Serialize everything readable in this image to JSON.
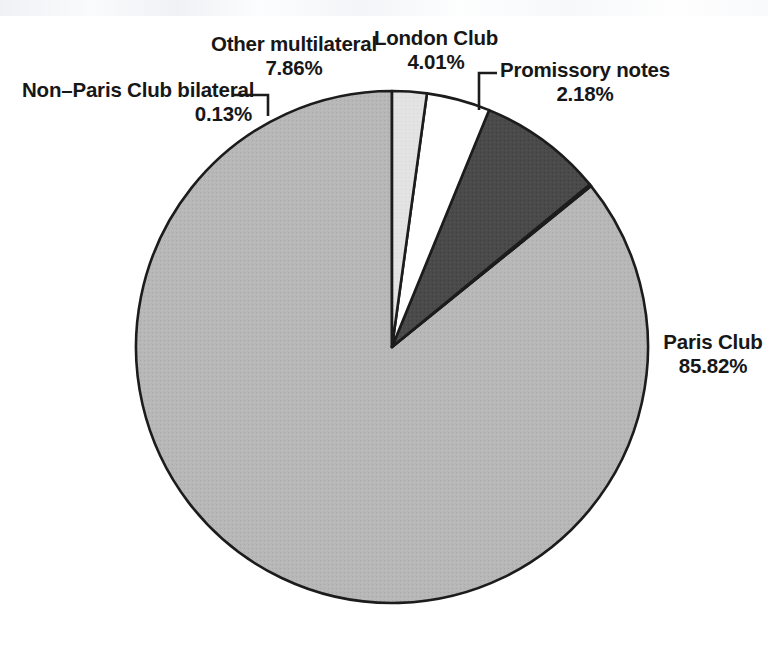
{
  "figure": {
    "background_color": "#ffffff",
    "outline_color": "#1c1c1c"
  },
  "chart_data": {
    "type": "pie",
    "title": "",
    "subtitle": "",
    "xlabel": "",
    "ylabel": "",
    "grid": false,
    "legend_position": "none",
    "units": "percent",
    "value_format": "0.00%",
    "total": 100.0,
    "start_angle_deg": 90,
    "direction": "counterclockwise",
    "categories": [
      "Paris Club",
      "Non–Paris Club bilateral",
      "Other multilateral",
      "London Club",
      "Promissory notes"
    ],
    "values": [
      85.82,
      0.13,
      7.86,
      4.01,
      2.18
    ],
    "labels": [
      "85.82%",
      "0.13%",
      "7.86%",
      "4.01%",
      "2.18%"
    ],
    "colors": [
      "#b4b4b4",
      "#f4f4f4",
      "#4a4a4a",
      "#ffffff",
      "#e2e2e2"
    ],
    "slices": [
      {
        "name": "Paris Club",
        "value": 85.82,
        "label": "85.82%",
        "color": "#b4b4b4",
        "label_placement": "outside-right",
        "leader_line": false
      },
      {
        "name": "Non–Paris Club bilateral",
        "value": 0.13,
        "label": "0.13%",
        "color": "#f4f4f4",
        "label_placement": "outside-left",
        "leader_line": true
      },
      {
        "name": "Other multilateral",
        "value": 7.86,
        "label": "7.86%",
        "color": "#4a4a4a",
        "label_placement": "outside-top",
        "leader_line": false
      },
      {
        "name": "London Club",
        "value": 4.01,
        "label": "4.01%",
        "color": "#ffffff",
        "label_placement": "outside-top",
        "leader_line": false
      },
      {
        "name": "Promissory notes",
        "value": 2.18,
        "label": "2.18%",
        "color": "#e2e2e2",
        "label_placement": "outside-top-right",
        "leader_line": true
      }
    ]
  },
  "labels": {
    "paris_club": {
      "name": "Paris Club",
      "pct": "85.82%"
    },
    "non_paris_club": {
      "name": "Non–Paris Club bilateral",
      "pct": "0.13%"
    },
    "other_multilateral": {
      "name": "Other multilateral",
      "pct": "7.86%"
    },
    "london_club": {
      "name": "London Club",
      "pct": "4.01%"
    },
    "promissory_notes": {
      "name": "Promissory notes",
      "pct": "2.18%"
    }
  }
}
